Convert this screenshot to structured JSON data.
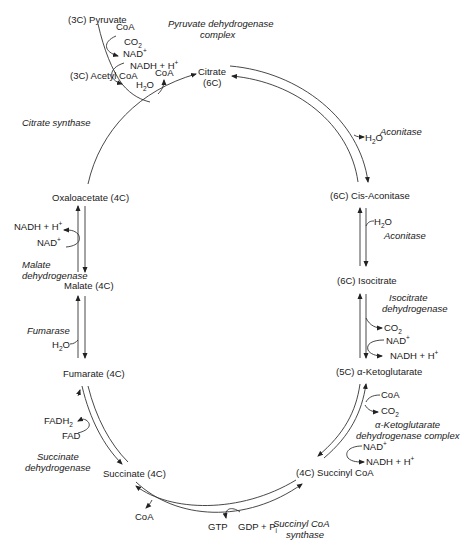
{
  "metabolites": {
    "pyruvate": "(3C) Pyruvate",
    "acetyl_coa": "(3C) Acetyl CoA",
    "citrate": "Citrate",
    "citrate_c": "(6C)",
    "cis_aconitase": "(6C) Cis-Aconitase",
    "isocitrate": "(6C) Isocitrate",
    "alpha_kg": "(5C) α-Ketoglutarate",
    "succinyl_coa": "(4C) Succinyl CoA",
    "succinate": "Succinate (4C)",
    "fumarate": "Fumarate (4C)",
    "malate": "Malate (4C)",
    "oxaloacetate": "Oxaloacetate (4C)"
  },
  "enzymes": {
    "pdh_line1": "Pyruvate dehydrogenase",
    "pdh_line2": "complex",
    "citrate_synthase": "Citrate synthase",
    "aconitase_1": "Aconitase",
    "aconitase_2": "Aconitase",
    "idh_line1": "Isocitrate",
    "idh_line2": "dehydrogenase",
    "akgdh_line1": "α-Ketoglutarate",
    "akgdh_line2": "dehydrogenase complex",
    "scs_line1": "Succinyl CoA",
    "scs_line2": "synthase",
    "sdh_line1": "Succinate",
    "sdh_line2": "dehydrogenase",
    "fumarase": "Fumarase",
    "mdh_line1": "Malate",
    "mdh_line2": "dehydrogenase"
  },
  "cofactors": {
    "coa": "CoA",
    "co": "CO",
    "sub2": "2",
    "nad": "NAD",
    "nadh": "NADH + H",
    "plus": "+",
    "h2o_h": "H",
    "h2o_o": "O",
    "fadh": "FADH",
    "fad": "FAD",
    "gtp": "GTP",
    "gdp": "GDP + P",
    "sub_i": "i"
  }
}
